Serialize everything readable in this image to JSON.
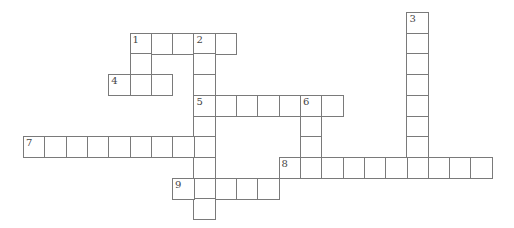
{
  "puzzle": {
    "type": "crossword",
    "grid": {
      "origin_x": 23,
      "origin_y": 12,
      "cell_w": 21.3,
      "cell_h": 20.7
    },
    "colors": {
      "line": "#7a7a7a",
      "number": "#444444",
      "fill": "#ffffff"
    },
    "words": [
      {
        "number": "1",
        "direction": "across",
        "col": 5,
        "row": 1,
        "length": 5
      },
      {
        "number": "1",
        "direction": "down",
        "col": 5,
        "row": 1,
        "length": 3
      },
      {
        "number": "2",
        "direction": "down",
        "col": 8,
        "row": 1,
        "length": 9
      },
      {
        "number": "3",
        "direction": "down",
        "col": 18,
        "row": 0,
        "length": 8
      },
      {
        "number": "4",
        "direction": "across",
        "col": 4,
        "row": 3,
        "length": 3
      },
      {
        "number": "5",
        "direction": "across",
        "col": 8,
        "row": 4,
        "length": 7
      },
      {
        "number": "6",
        "direction": "down",
        "col": 13,
        "row": 4,
        "length": 4
      },
      {
        "number": "7",
        "direction": "across",
        "col": 0,
        "row": 6,
        "length": 9
      },
      {
        "number": "8",
        "direction": "across",
        "col": 12,
        "row": 7,
        "length": 10
      },
      {
        "number": "9",
        "direction": "across",
        "col": 7,
        "row": 8,
        "length": 5
      }
    ]
  }
}
